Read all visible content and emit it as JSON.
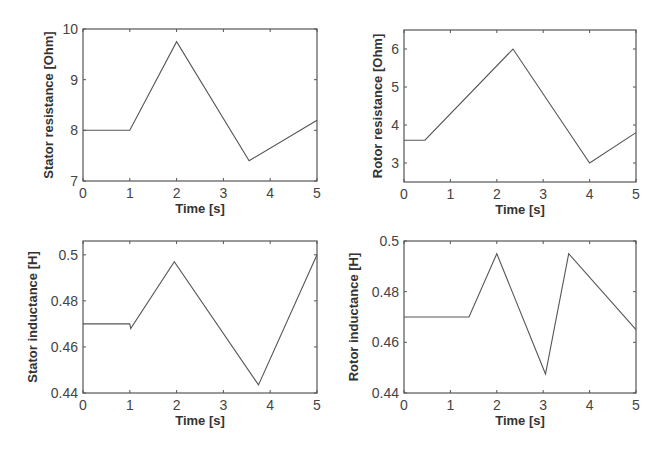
{
  "chart_data": [
    {
      "type": "line",
      "title": "",
      "xlabel": "Time [s]",
      "ylabel": "Stator resistance [Ohm]",
      "xlim": [
        0,
        5
      ],
      "ylim": [
        7,
        10
      ],
      "xticks": [
        0,
        1,
        2,
        3,
        4,
        5
      ],
      "yticks": [
        7,
        8,
        9,
        10
      ],
      "ytick_labels": [
        "7",
        "8",
        "9",
        "10"
      ],
      "grid": false,
      "box": {
        "left": 83,
        "top": 29,
        "right": 317,
        "bottom": 181
      },
      "x": [
        0,
        1,
        2,
        3.55,
        5
      ],
      "y": [
        8,
        8,
        9.75,
        7.4,
        8.2
      ]
    },
    {
      "type": "line",
      "title": "",
      "xlabel": "Time [s]",
      "ylabel": "Rotor resistance [Ohm]",
      "xlim": [
        0,
        5
      ],
      "ylim": [
        2.5,
        6.5
      ],
      "xticks": [
        0,
        1,
        2,
        3,
        4,
        5
      ],
      "yticks": [
        3,
        4,
        5,
        6
      ],
      "ytick_labels": [
        "3",
        "4",
        "5",
        "6"
      ],
      "grid": false,
      "box": {
        "left": 404,
        "top": 30,
        "right": 636,
        "bottom": 182
      },
      "x": [
        0,
        0.45,
        2.35,
        4,
        5
      ],
      "y": [
        3.6,
        3.6,
        6.0,
        3.0,
        3.8
      ]
    },
    {
      "type": "line",
      "title": "",
      "xlabel": "Time [s]",
      "ylabel": "Stator inductance [H]",
      "xlim": [
        0,
        5
      ],
      "ylim": [
        0.44,
        0.506
      ],
      "xticks": [
        0,
        1,
        2,
        3,
        4,
        5
      ],
      "yticks": [
        0.44,
        0.46,
        0.48,
        0.5
      ],
      "ytick_labels": [
        "0.44",
        "0.46",
        "0.48",
        "0.5"
      ],
      "grid": false,
      "box": {
        "left": 83,
        "top": 241,
        "right": 317,
        "bottom": 393
      },
      "x": [
        0,
        1.0,
        1.02,
        1.95,
        3.75,
        5
      ],
      "y": [
        0.47,
        0.47,
        0.468,
        0.497,
        0.4435,
        0.5
      ]
    },
    {
      "type": "line",
      "title": "",
      "xlabel": "Time [s]",
      "ylabel": "Rotor inductance [H]",
      "xlim": [
        0,
        5
      ],
      "ylim": [
        0.44,
        0.5
      ],
      "xticks": [
        0,
        1,
        2,
        3,
        4,
        5
      ],
      "yticks": [
        0.44,
        0.46,
        0.48,
        0.5
      ],
      "ytick_labels": [
        "0.44",
        "0.46",
        "0.48",
        "0.5"
      ],
      "grid": false,
      "box": {
        "left": 404,
        "top": 241,
        "right": 636,
        "bottom": 393
      },
      "x": [
        0,
        1.4,
        2.0,
        3.05,
        3.55,
        5
      ],
      "y": [
        0.47,
        0.47,
        0.495,
        0.4475,
        0.495,
        0.465
      ]
    }
  ],
  "colors": {
    "line": "#555555",
    "axes": "#555555",
    "text": "#444444"
  }
}
